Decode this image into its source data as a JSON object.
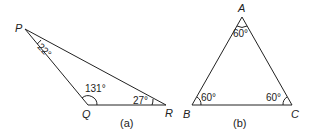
{
  "figures": [
    {
      "id": "a",
      "caption": "(a)",
      "vertices": [
        {
          "name": "P",
          "label": "P"
        },
        {
          "name": "Q",
          "label": "Q"
        },
        {
          "name": "R",
          "label": "R"
        }
      ],
      "angles": [
        {
          "vertex": "P",
          "label": "22°"
        },
        {
          "vertex": "Q",
          "label": "131°"
        },
        {
          "vertex": "R",
          "label": "27°"
        }
      ]
    },
    {
      "id": "b",
      "caption": "(b)",
      "vertices": [
        {
          "name": "A",
          "label": "A"
        },
        {
          "name": "B",
          "label": "B"
        },
        {
          "name": "C",
          "label": "C"
        }
      ],
      "angles": [
        {
          "vertex": "A",
          "label": "60°"
        },
        {
          "vertex": "B",
          "label": "60°"
        },
        {
          "vertex": "C",
          "label": "60°"
        }
      ]
    }
  ],
  "colors": {
    "line": "#222222",
    "background": "#ffffff"
  }
}
